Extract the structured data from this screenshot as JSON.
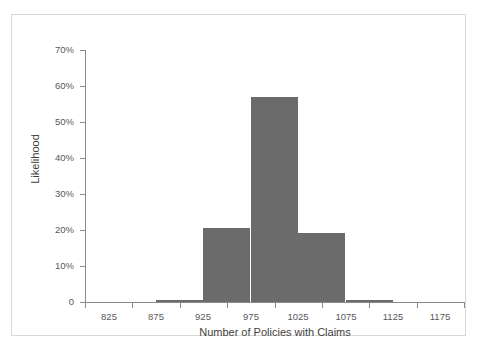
{
  "chart_data": {
    "type": "bar",
    "title": "",
    "subtitle": "",
    "xlabel": "Number of Policies with Claims",
    "ylabel": "Likelihood",
    "grid": false,
    "legend": "none",
    "xlim": [
      800,
      1200
    ],
    "ylim": [
      0,
      70
    ],
    "xtick_labels": [
      "825",
      "875",
      "925",
      "975",
      "1025",
      "1075",
      "1125",
      "1175"
    ],
    "xtick_values": [
      825,
      875,
      925,
      975,
      1025,
      1075,
      1125,
      1175
    ],
    "ytick_labels": [
      "0",
      "10%",
      "20%",
      "30%",
      "40%",
      "50%",
      "60%",
      "70%"
    ],
    "ytick_values": [
      0,
      10,
      20,
      30,
      40,
      50,
      60,
      70
    ],
    "bin_width": 50,
    "categories": [
      "900",
      "950",
      "1000",
      "1050",
      "1100"
    ],
    "x": [
      900,
      950,
      1000,
      1050,
      1100
    ],
    "values": [
      0.5,
      20.6,
      57.0,
      19.2,
      0.6
    ],
    "bar_color": "#6b6b6b",
    "axis_color": "#8a8a8a",
    "text_color": "#58585a",
    "background": "#ffffff",
    "frame_color": "#d8d8d8"
  }
}
